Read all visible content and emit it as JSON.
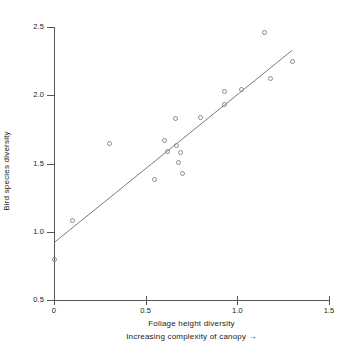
{
  "chart_data": {
    "type": "scatter",
    "title": "",
    "xlabel": "Foliage height diversity",
    "xlabel_secondary": "Increasing complexity of canopy →",
    "ylabel": "Bird species diversity",
    "xlim": [
      0,
      1.5
    ],
    "ylim": [
      0.5,
      2.5
    ],
    "xticks": [
      0,
      0.5,
      1.0,
      1.5
    ],
    "xtick_labels": [
      "0",
      "0.5",
      "1.0",
      "1.5"
    ],
    "yticks": [
      0.5,
      1.0,
      1.5,
      2.0,
      2.5
    ],
    "ytick_labels": [
      "0.5",
      "1.0",
      "1.5",
      "2.0",
      "2.5"
    ],
    "grid": false,
    "legend": null,
    "marker": "open-circle",
    "marker_color": "#8a8a8a",
    "axis_color": "#555555",
    "text_color": "#1a1a1a",
    "background_color": "#ffffff",
    "points": [
      {
        "x": 0.0,
        "y": 0.8
      },
      {
        "x": 0.1,
        "y": 1.08
      },
      {
        "x": 0.3,
        "y": 1.65
      },
      {
        "x": 0.55,
        "y": 1.38
      },
      {
        "x": 0.6,
        "y": 1.67
      },
      {
        "x": 0.62,
        "y": 1.59
      },
      {
        "x": 0.66,
        "y": 1.83
      },
      {
        "x": 0.67,
        "y": 1.63
      },
      {
        "x": 0.68,
        "y": 1.51
      },
      {
        "x": 0.69,
        "y": 1.58
      },
      {
        "x": 0.7,
        "y": 1.43
      },
      {
        "x": 0.8,
        "y": 1.84
      },
      {
        "x": 0.93,
        "y": 1.93
      },
      {
        "x": 0.93,
        "y": 2.03
      },
      {
        "x": 1.02,
        "y": 2.04
      },
      {
        "x": 1.15,
        "y": 2.46
      },
      {
        "x": 1.18,
        "y": 2.12
      },
      {
        "x": 1.3,
        "y": 2.25
      }
    ],
    "trendline": {
      "type": "linear",
      "x_start": 0.0,
      "y_start": 0.92,
      "x_end": 1.3,
      "y_end": 2.33,
      "slope": 1.085,
      "intercept": 0.92,
      "color": "#6b6b6b"
    }
  }
}
